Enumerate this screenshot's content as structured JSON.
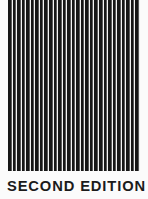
{
  "cover": {
    "background_color": "#fbfbfb",
    "stripe_color": "#161616",
    "stripe_gap_color": "#f2f2f2",
    "text_color": "#1b1b1b",
    "edition_label": "SECOND EDITION",
    "stripe_band": {
      "name": "vertical-stripe-pattern",
      "stripe_count": 29,
      "pitch_px": 4.55,
      "bar_width_px": 2.6,
      "left_px": 8,
      "top_px": 0,
      "width_px": 132,
      "height_px": 171
    }
  }
}
